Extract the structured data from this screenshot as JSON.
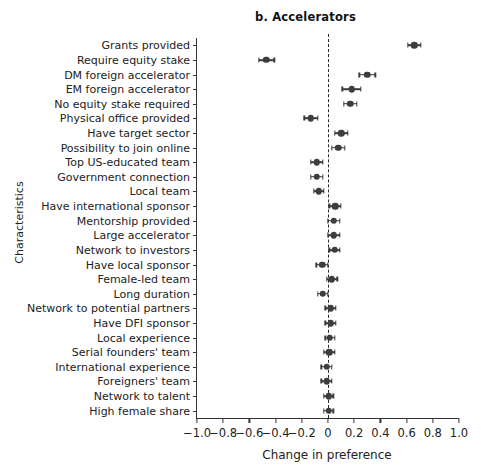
{
  "chart_data": {
    "type": "scatter",
    "subtype": "coefficient-plot-with-confidence-intervals",
    "title": "b. Accelerators",
    "xlabel": "Change in preference",
    "ylabel": "Characteristics",
    "xlim": [
      -1.0,
      1.0
    ],
    "grid": false,
    "legend": null,
    "reference_line": {
      "x": 0,
      "style": "dashed"
    },
    "xticks": [
      -1.0,
      -0.8,
      -0.6,
      -0.4,
      -0.2,
      0,
      0.2,
      0.4,
      0.6,
      0.8,
      1.0
    ],
    "xticklabels": [
      "-1.0",
      "-0.8",
      "-0.6",
      "-0.4",
      "-0.2",
      "0",
      "0.2",
      "0.4",
      "0.6",
      "0.8",
      "1.0"
    ],
    "categories": [
      "Grants provided",
      "Require equity stake",
      "DM foreign accelerator",
      "EM foreign accelerator",
      "No equity stake required",
      "Physical office provided",
      "Have target sector",
      "Possibility to join online",
      "Top US-educated team",
      "Government connection",
      "Local team",
      "Have international sponsor",
      "Mentorship provided",
      "Large accelerator",
      "Network to investors",
      "Have local sponsor",
      "Female-led team",
      "Long duration",
      "Network to potential partners",
      "Have DFI sponsor",
      "Local experience",
      "Serial founders' team",
      "International experience",
      "Foreigners' team",
      "Network to talent",
      "High female share"
    ],
    "values": [
      0.66,
      -0.47,
      0.3,
      0.18,
      0.17,
      -0.13,
      0.1,
      0.08,
      -0.085,
      -0.085,
      -0.07,
      0.055,
      0.045,
      0.045,
      0.05,
      -0.045,
      0.03,
      -0.04,
      0.02,
      0.02,
      0.015,
      0.01,
      -0.01,
      -0.01,
      0.005,
      0.005
    ],
    "ci_low": [
      0.61,
      -0.53,
      0.24,
      0.11,
      0.12,
      -0.18,
      0.05,
      0.03,
      -0.13,
      -0.13,
      -0.11,
      0.01,
      0.0,
      0.0,
      0.01,
      -0.09,
      -0.01,
      -0.08,
      -0.02,
      -0.02,
      -0.02,
      -0.03,
      -0.05,
      -0.05,
      -0.03,
      -0.03
    ],
    "ci_high": [
      0.71,
      -0.41,
      0.36,
      0.25,
      0.22,
      -0.08,
      0.15,
      0.13,
      -0.04,
      -0.04,
      -0.03,
      0.1,
      0.09,
      0.09,
      0.09,
      0.0,
      0.07,
      0.0,
      0.06,
      0.06,
      0.05,
      0.05,
      0.03,
      0.03,
      0.04,
      0.04
    ],
    "marker_color": "#3d3d3d",
    "line_color": "#3a3a3a"
  }
}
